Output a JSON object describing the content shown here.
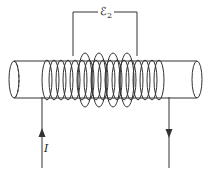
{
  "diagram": {
    "labels": {
      "emf_symbol": "ℰ",
      "emf_subscript": "2",
      "current": "I"
    },
    "components": [
      {
        "name": "cylinder-core",
        "description": "horizontal cylindrical core"
      },
      {
        "name": "primary-solenoid",
        "description": "tightly wound coil along the core, carrying current I"
      },
      {
        "name": "secondary-coil",
        "description": "larger loops around middle of solenoid with terminals across which ℰ2 appears"
      },
      {
        "name": "current-lead-in",
        "description": "wire entering on left with upward arrow"
      },
      {
        "name": "current-lead-out",
        "description": "wire leaving on right with downward arrow"
      }
    ],
    "colors": {
      "stroke": "#333333",
      "background": "#ffffff"
    }
  }
}
